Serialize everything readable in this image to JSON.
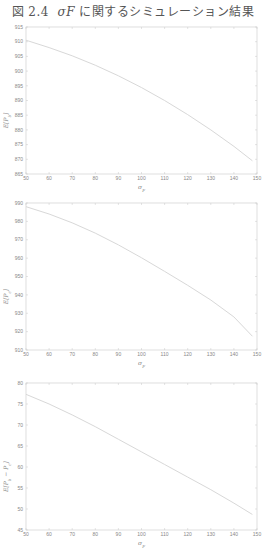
{
  "figure": {
    "caption_prefix": "図 2.4",
    "caption_symbol": "σF",
    "caption_suffix": "に関するシミュレーション結果",
    "line_color": "#d8d8d8",
    "axis_color": "#c8c8c8"
  },
  "chart_data": [
    {
      "type": "line",
      "title": "",
      "xlabel": "σ_F",
      "ylabel": "E[P_b]",
      "xlim": [
        50,
        150
      ],
      "ylim": [
        865,
        915
      ],
      "xticks": [
        50,
        60,
        70,
        80,
        90,
        100,
        110,
        120,
        130,
        140,
        150
      ],
      "yticks": [
        865,
        870,
        875,
        880,
        885,
        890,
        895,
        900,
        905,
        910,
        915
      ],
      "grid": false,
      "series": [
        {
          "name": "E[P_b]",
          "x": [
            50,
            60,
            70,
            80,
            90,
            100,
            110,
            120,
            130,
            140,
            148
          ],
          "y": [
            910.5,
            908.0,
            905.2,
            902.0,
            898.4,
            894.4,
            890.0,
            885.2,
            880.0,
            874.4,
            869.5
          ]
        }
      ]
    },
    {
      "type": "line",
      "title": "",
      "xlabel": "σ_F",
      "ylabel": "E[P_c]",
      "xlim": [
        50,
        150
      ],
      "ylim": [
        910,
        990
      ],
      "xticks": [
        50,
        60,
        70,
        80,
        90,
        100,
        110,
        120,
        130,
        140,
        150
      ],
      "yticks": [
        910,
        920,
        930,
        940,
        950,
        960,
        970,
        980,
        990
      ],
      "grid": false,
      "series": [
        {
          "name": "E[P_c]",
          "x": [
            50,
            60,
            70,
            80,
            90,
            100,
            110,
            120,
            130,
            140,
            148
          ],
          "y": [
            988.0,
            984.0,
            979.2,
            973.6,
            967.2,
            960.2,
            952.8,
            945.2,
            937.2,
            928.0,
            917.5
          ]
        }
      ]
    },
    {
      "type": "line",
      "title": "",
      "xlabel": "σ_F",
      "ylabel": "E[P_b − P_c]",
      "xlim": [
        50,
        150
      ],
      "ylim": [
        45,
        80
      ],
      "xticks": [
        50,
        60,
        70,
        80,
        90,
        100,
        110,
        120,
        130,
        140,
        150
      ],
      "yticks": [
        45,
        50,
        55,
        60,
        65,
        70,
        75,
        80
      ],
      "grid": false,
      "series": [
        {
          "name": "E[P_b − P_c]",
          "x": [
            50,
            60,
            70,
            80,
            90,
            100,
            110,
            120,
            130,
            140,
            148
          ],
          "y": [
            77.3,
            75.0,
            72.4,
            69.6,
            66.6,
            63.6,
            60.6,
            57.6,
            54.6,
            51.4,
            48.7
          ]
        }
      ]
    }
  ]
}
